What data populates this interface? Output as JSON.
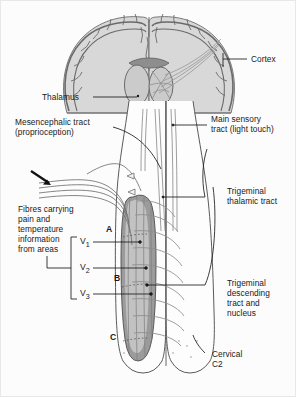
{
  "figure": {
    "background_color": "#fcfcfc",
    "border_color": "#e8e8e8",
    "ink_color": "#1a1a1a",
    "brain_fill": "#d4d4d4",
    "brain_stroke": "#6f6f6f",
    "nucleus_fill": "#8a8a8a",
    "tract_stroke": "#8d8d8d"
  },
  "labels": {
    "cortex": "Cortex",
    "thalamus": "Thalamus",
    "mesencephalic_line1": "Mesencephalic tract",
    "mesencephalic_line2": "(proprioception)",
    "main_sensory_line1": "Main sensory",
    "main_sensory_line2": "tract (light touch)",
    "trigeminal_thalamic_line1": "Trigeminal",
    "trigeminal_thalamic_line2": "thalamic tract",
    "fibres_line1": "Fibres carrying",
    "fibres_line2": "pain and",
    "fibres_line3": "temperature",
    "fibres_line4": "information",
    "fibres_line5": "from areas",
    "descending_line1": "Trigeminal",
    "descending_line2": "descending",
    "descending_line3": "tract and",
    "descending_line4": "nucleus",
    "cervical_line1": "Cervical",
    "cervical_line2": "C2",
    "v1": "V",
    "v1_sub": "1",
    "v2": "V",
    "v2_sub": "2",
    "v3": "V",
    "v3_sub": "3",
    "zone_a": "A",
    "zone_b": "B",
    "zone_c": "C"
  }
}
